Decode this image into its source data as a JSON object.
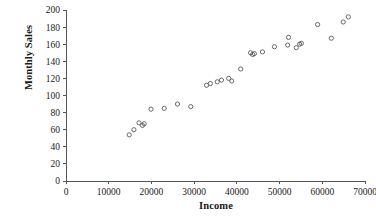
{
  "chart_data": {
    "type": "scatter",
    "title": "",
    "xlabel": "Income",
    "ylabel": "Monthly Sales",
    "xlim": [
      0,
      70000
    ],
    "ylim": [
      0,
      200
    ],
    "xticks": [
      0,
      10000,
      20000,
      30000,
      40000,
      50000,
      60000,
      70000
    ],
    "yticks": [
      0,
      20,
      40,
      60,
      80,
      100,
      120,
      140,
      160,
      180,
      200
    ],
    "xtick_labels": [
      "0",
      "10000",
      "20000",
      "30000",
      "40000",
      "50000",
      "60000",
      "70000"
    ],
    "ytick_labels": [
      "0",
      "20",
      "40",
      "60",
      "80",
      "100",
      "120",
      "140",
      "160",
      "180",
      "200"
    ],
    "grid": false,
    "legend": false,
    "marker": "open-circle",
    "marker_color": "#5a5a5a",
    "series": [
      {
        "name": "Observations",
        "x": [
          14800,
          15900,
          17100,
          17900,
          18300,
          19900,
          23000,
          26100,
          29200,
          32900,
          33800,
          35400,
          36400,
          38100,
          38800,
          40900,
          43200,
          43700,
          44100,
          46000,
          48800,
          51900,
          52100,
          53900,
          54700,
          55100,
          58900,
          62100,
          64900,
          66100
        ],
        "y": [
          54,
          60,
          68,
          65,
          67,
          84,
          85,
          90,
          87,
          112,
          114,
          116,
          118,
          120,
          117,
          131,
          150,
          148,
          149,
          151,
          157,
          159,
          168,
          156,
          160,
          161,
          183,
          167,
          186,
          192
        ]
      }
    ]
  },
  "axis": {
    "x_label_text": "Income",
    "y_label_text": "Monthly Sales"
  }
}
